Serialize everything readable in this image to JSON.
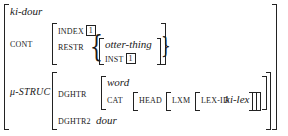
{
  "avm": {
    "type": "ki-dour",
    "cont": {
      "label": "CONT",
      "index": {
        "label": "INDEX",
        "tag": "1"
      },
      "restr": {
        "label": "RESTR",
        "set_open": "{",
        "set_close": "}",
        "element": {
          "type": "otter-thing",
          "inst": {
            "label": "INST",
            "tag": "1"
          }
        }
      }
    },
    "mu_struc": {
      "label": "μ-STRUC",
      "dghtr": {
        "label": "DGHTR",
        "type": "word",
        "cat": {
          "label": "CAT",
          "head": {
            "label": "HEAD",
            "lxm": {
              "label": "LXM",
              "lex_id": {
                "label": "LEX-ID",
                "value": "ki-lex"
              }
            }
          }
        }
      },
      "dghtr2": {
        "label": "DGHTR2",
        "value": "dour"
      }
    }
  }
}
